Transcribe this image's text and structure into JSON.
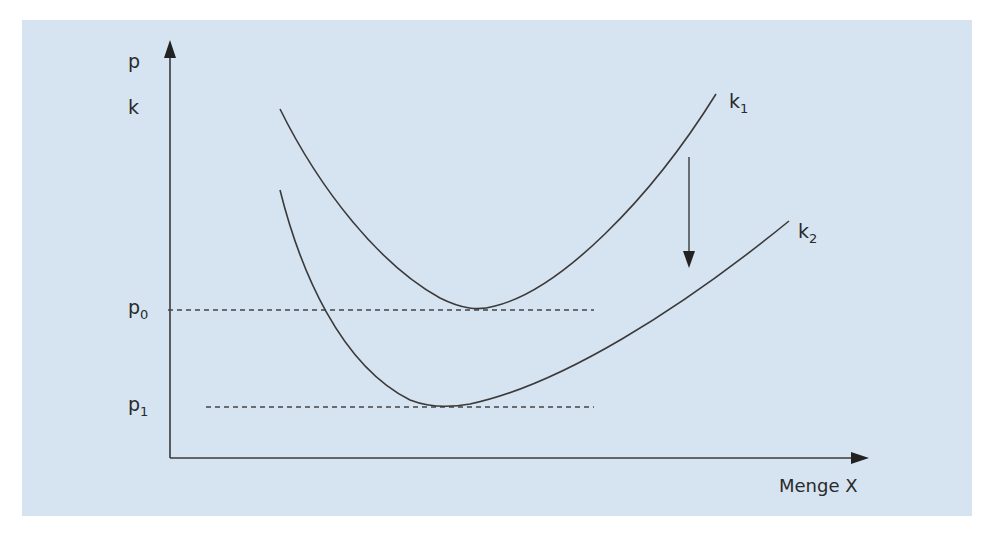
{
  "diagram": {
    "type": "cost-curve-shift",
    "axes": {
      "y_label": "p",
      "y_secondary_label": "k",
      "x_label": "Menge X"
    },
    "price_levels": [
      {
        "symbol": "p",
        "subscript": "0"
      },
      {
        "symbol": "p",
        "subscript": "1"
      }
    ],
    "curves": [
      {
        "symbol": "k",
        "subscript": "1"
      },
      {
        "symbol": "k",
        "subscript": "2"
      }
    ],
    "annotation": "shift-down-arrow from k1 to k2",
    "colors": {
      "background": "#d6e3f1",
      "line": "#3a3a3a",
      "text": "#2a2a2a"
    }
  }
}
